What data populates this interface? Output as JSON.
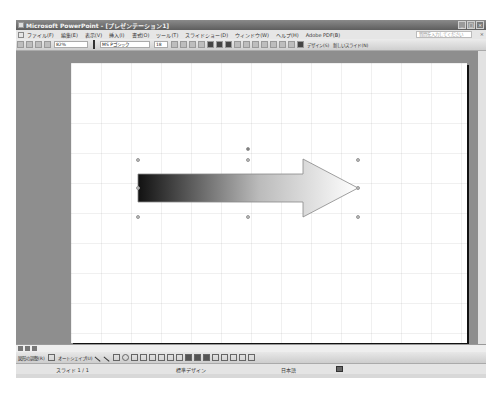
{
  "window": {
    "title": "Microsoft PowerPoint - [プレゼンテーション1]",
    "controls": [
      "minimize",
      "maximize",
      "close"
    ]
  },
  "menubar": {
    "items": [
      {
        "label": "ファイル(F)"
      },
      {
        "label": "編集(E)"
      },
      {
        "label": "表示(V)"
      },
      {
        "label": "挿入(I)"
      },
      {
        "label": "書式(O)"
      },
      {
        "label": "ツール(T)"
      },
      {
        "label": "スライドショー(D)"
      },
      {
        "label": "ウィンドウ(W)"
      },
      {
        "label": "ヘルプ(H)"
      },
      {
        "label": "Adobe PDF(B)"
      }
    ],
    "help_placeholder": "質問を入力してください",
    "close_label": "×"
  },
  "toolbar": {
    "zoom": "82%",
    "font_name": "MS Pゴシック",
    "font_size": "18",
    "design_label": "デザイン(S)",
    "new_slide_label": "新しいスライド(N)"
  },
  "slide": {
    "shape": "right-arrow",
    "fill": "gradient black to white",
    "gradient_start": "#111111",
    "gradient_end": "#ffffff",
    "outline_color": "#888888"
  },
  "drawbar": {
    "draw_label": "図形の調整(R)",
    "autoshape_label": "オートシェイプ(U)"
  },
  "statusbar": {
    "slide_position": "スライド 1 / 1",
    "design_name": "標準デザイン",
    "language": "日本語"
  }
}
